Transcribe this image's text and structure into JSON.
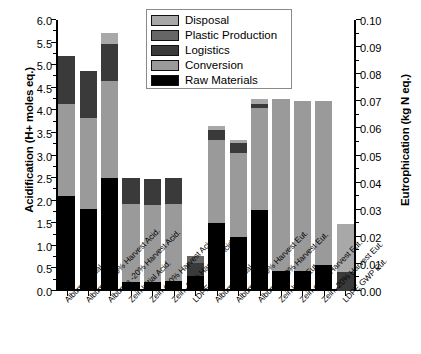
{
  "chart_data": {
    "type": "bar",
    "title": "",
    "stacked": true,
    "grid": false,
    "legend_position": "top-center",
    "ylabel": "Acidification (H+ moles eq.)",
    "ylabel_right": "Eutrophication (kg N eq.)",
    "xlabel": "",
    "ylim": [
      0,
      6.0
    ],
    "ylim_right": [
      0,
      0.1
    ],
    "ytick_labels": [
      "0.0",
      "0.5",
      "1.0",
      "1.5",
      "2.0",
      "2.5",
      "3.0",
      "3.5",
      "4.0",
      "4.5",
      "5.0",
      "5.5",
      "6.0"
    ],
    "ytick_values": [
      0,
      0.5,
      1.0,
      1.5,
      2.0,
      2.5,
      3.0,
      3.5,
      4.0,
      4.5,
      5.0,
      5.5,
      6.0
    ],
    "ytick_labels_right": [
      "0.00",
      "0.01",
      "0.02",
      "0.03",
      "0.04",
      "0.05",
      "0.06",
      "0.07",
      "0.08",
      "0.09",
      "0.10"
    ],
    "ytick_values_right": [
      0,
      0.01,
      0.02,
      0.03,
      0.04,
      0.05,
      0.06,
      0.07,
      0.08,
      0.09,
      0.1
    ],
    "categories": [
      "Albumin Initial Acid.",
      "Albumin +20% Harvest Acid.",
      "Albumin -20% Harvest Acid.",
      "Zein Initial Acid.",
      "Zein +20% Harvest Acid.",
      "Zein -20% Harvest Acid.",
      "LDPE Acid.",
      "Albumin Initial Eut.",
      "Albumin +20% Harvest Eut.",
      "Albumin -20% Harvest Eut.",
      "Zein Initial Eut.",
      "Zein +20% Harvest Eut.",
      "Zein -20% Harvest Eut.",
      "LDPE GWP Eut."
    ],
    "category_axis": [
      "left",
      "left",
      "left",
      "left",
      "left",
      "left",
      "left",
      "right",
      "right",
      "right",
      "right",
      "right",
      "right",
      "right"
    ],
    "series": [
      {
        "name": "Raw Materials",
        "color": "#000000",
        "values": [
          2.1,
          1.82,
          2.5,
          0.2,
          0.2,
          0.22,
          0.33,
          1.5,
          1.2,
          1.8,
          0.45,
          0.45,
          0.58,
          0.0
        ]
      },
      {
        "name": "Conversion",
        "color": "#9a9a9a",
        "values": [
          2.05,
          2.0,
          2.15,
          1.73,
          1.7,
          1.7,
          0.0,
          1.85,
          1.85,
          2.25,
          3.8,
          3.75,
          3.62,
          0.0
        ]
      },
      {
        "name": "Logistics",
        "color": "#3a3a3a",
        "values": [
          1.05,
          1.06,
          0.82,
          0.57,
          0.57,
          0.58,
          0.3,
          0.22,
          0.22,
          0.08,
          0.0,
          0.0,
          0.0,
          0.42
        ]
      },
      {
        "name": "Plastic Production",
        "color": "#666666",
        "values": [
          0.0,
          0.0,
          0.0,
          0.0,
          0.0,
          0.0,
          0.15,
          0.0,
          0.0,
          0.0,
          0.0,
          0.0,
          0.0,
          0.0
        ]
      },
      {
        "name": "Disposal",
        "color": "#a8a8a8",
        "values": [
          0.0,
          0.0,
          0.25,
          0.0,
          0.0,
          0.0,
          0.0,
          0.08,
          0.08,
          0.12,
          0.0,
          0.0,
          0.0,
          1.07
        ]
      }
    ],
    "totals": [
      5.2,
      4.88,
      5.72,
      2.5,
      2.47,
      2.5,
      0.78,
      3.65,
      3.35,
      4.25,
      4.25,
      4.2,
      4.2,
      1.49
    ]
  },
  "legend": {
    "items": [
      {
        "label": "Disposal",
        "color": "#a8a8a8"
      },
      {
        "label": "Plastic Production",
        "color": "#666666"
      },
      {
        "label": "Logistics",
        "color": "#3a3a3a"
      },
      {
        "label": "Conversion",
        "color": "#9a9a9a"
      },
      {
        "label": "Raw Materials",
        "color": "#000000"
      }
    ]
  }
}
